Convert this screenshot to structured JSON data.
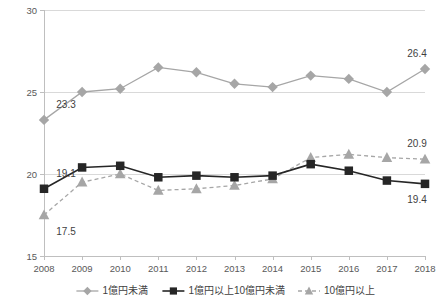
{
  "chart_data": {
    "type": "line",
    "title": "",
    "xlabel": "",
    "ylabel": "",
    "ylim": [
      15,
      30
    ],
    "yticks": [
      15,
      20,
      25,
      30
    ],
    "grid": true,
    "legend_position": "bottom",
    "categories": [
      "2008",
      "2009",
      "2010",
      "2011",
      "2012",
      "2013",
      "2014",
      "2015",
      "2016",
      "2017",
      "2018"
    ],
    "series": [
      {
        "name": "1億円未満",
        "marker": "diamond",
        "color": "#a6a6a6",
        "linestyle": "solid",
        "values": [
          23.3,
          25.0,
          25.2,
          26.5,
          26.2,
          25.5,
          25.3,
          26.0,
          25.8,
          25.0,
          26.4
        ],
        "point_labels": [
          {
            "index": 0,
            "text": "23.3"
          },
          {
            "index": 10,
            "text": "26.4"
          }
        ]
      },
      {
        "name": "1億円以上10億円未満",
        "marker": "square",
        "color": "#262626",
        "linestyle": "solid",
        "values": [
          19.1,
          20.4,
          20.5,
          19.8,
          19.9,
          19.8,
          19.9,
          20.6,
          20.2,
          19.6,
          19.4
        ],
        "point_labels": [
          {
            "index": 0,
            "text": "19.1"
          },
          {
            "index": 10,
            "text": "19.4"
          }
        ]
      },
      {
        "name": "10億円以上",
        "marker": "triangle",
        "color": "#a6a6a6",
        "linestyle": "dashed",
        "values": [
          17.5,
          19.5,
          20.0,
          19.0,
          19.1,
          19.3,
          19.7,
          21.0,
          21.2,
          21.0,
          20.9
        ],
        "point_labels": [
          {
            "index": 0,
            "text": "17.5"
          },
          {
            "index": 10,
            "text": "20.9"
          }
        ]
      }
    ]
  },
  "colors": {
    "series1": "#a6a6a6",
    "series2": "#262626",
    "series3": "#a6a6a6",
    "gridline": "#d9d9d9",
    "axis": "#bfbfbf",
    "text": "#3f3f3f"
  }
}
